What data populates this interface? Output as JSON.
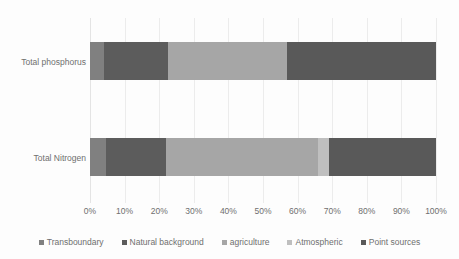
{
  "chart_data": {
    "type": "bar",
    "orientation": "horizontal",
    "stacked": true,
    "normalized": true,
    "title": "",
    "subtitle": "",
    "xlabel": "",
    "ylabel": "",
    "categories": [
      "Total phosphorus",
      "Total Nitrogen"
    ],
    "xlim": [
      0,
      100
    ],
    "xtick_labels": [
      "0%",
      "10%",
      "20%",
      "30%",
      "40%",
      "50%",
      "60%",
      "70%",
      "80%",
      "90%",
      "100%"
    ],
    "xtick_values": [
      0,
      10,
      20,
      30,
      40,
      50,
      60,
      70,
      80,
      90,
      100
    ],
    "grid": "vertical",
    "legend_position": "bottom",
    "series": [
      {
        "name": "Transboundary",
        "color": "#808080",
        "values": [
          4,
          4.5
        ]
      },
      {
        "name": "Natural background",
        "color": "#5c5c5c",
        "values": [
          18.5,
          17.5
        ]
      },
      {
        "name": "agriculture",
        "color": "#a6a6a6",
        "values": [
          34.5,
          44
        ]
      },
      {
        "name": "Atmospheric",
        "color": "#bfbfbf",
        "values": [
          0,
          3
        ]
      },
      {
        "name": "Point sources",
        "color": "#595959",
        "values": [
          43,
          31
        ]
      }
    ]
  },
  "colors": {
    "background": "#fdfdfd",
    "gridline": "#ececec",
    "text": "#6f6f6f"
  }
}
